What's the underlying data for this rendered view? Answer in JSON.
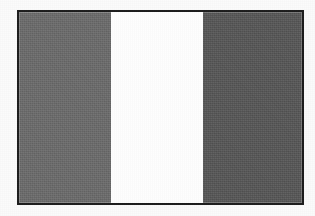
{
  "image": {
    "subject": "vertical tricolour flag",
    "rendering": "grayscale print reproduction",
    "page_background_color": "#fbfbfb",
    "plate": {
      "border_color": "#1c1c1c",
      "border_width_px": 2,
      "x": 17,
      "y": 10,
      "width": 287,
      "height": 195
    },
    "bands": [
      {
        "name": "hoist-band",
        "label": "left band",
        "color": "#6b6b6b",
        "width_percent": 32.5
      },
      {
        "name": "middle-band",
        "label": "centre band",
        "color": "#ffffff",
        "width_percent": 32.5
      },
      {
        "name": "fly-band",
        "label": "right band",
        "color": "#565656",
        "width_percent": 35.0
      }
    ]
  }
}
